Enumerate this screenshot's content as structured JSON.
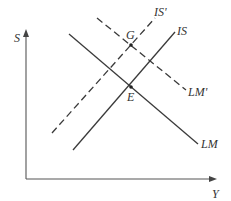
{
  "diagram": {
    "type": "IS-LM diagram",
    "axes": {
      "y_label": "S",
      "x_label": "Y"
    },
    "curves": [
      {
        "id": "LM",
        "label": "LM",
        "style": "solid"
      },
      {
        "id": "IS",
        "label": "IS",
        "style": "solid"
      },
      {
        "id": "IS_prime",
        "label": "IS'",
        "style": "dashed"
      },
      {
        "id": "LM_prime",
        "label": "LM'",
        "style": "dashed"
      }
    ],
    "points": [
      {
        "id": "E",
        "label": "E",
        "description": "intersection of IS and LM"
      },
      {
        "id": "G",
        "label": "G",
        "description": "intersection of IS' and LM'"
      }
    ],
    "colors": {
      "line": "#3a3a3a",
      "axis": "#555555",
      "background": "#ffffff"
    }
  }
}
